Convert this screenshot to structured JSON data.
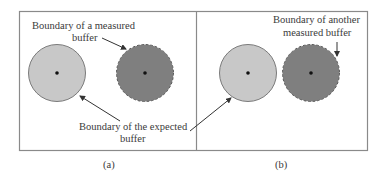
{
  "figure": {
    "panels": [
      {
        "caption": "(a)",
        "labels": {
          "measured_line1": "Boundary of a measured",
          "measured_line2": "buffer",
          "expected_line1": "Boundary of the expected",
          "expected_line2": "buffer"
        },
        "circles": [
          {
            "name": "expected-buffer",
            "fill": "#c8c8c8",
            "stroke": "#7a7a7a",
            "style": "solid"
          },
          {
            "name": "measured-buffer",
            "fill": "#7f7f7f",
            "stroke": "#5a5a5a",
            "style": "dashed"
          }
        ]
      },
      {
        "caption": "(b)",
        "labels": {
          "measured_line1": "Boundary of another",
          "measured_line2": "measured buffer"
        },
        "circles": [
          {
            "name": "expected-buffer",
            "fill": "#c8c8c8",
            "stroke": "#7a7a7a",
            "style": "solid"
          },
          {
            "name": "measured-buffer",
            "fill": "#7f7f7f",
            "stroke": "#5a5a5a",
            "style": "dashed"
          }
        ]
      }
    ],
    "colors": {
      "frame": "#8a8a8a",
      "light_fill": "#c8c8c8",
      "dark_fill": "#7f7f7f",
      "arrow": "#333333",
      "text": "#3a3a3a"
    }
  }
}
